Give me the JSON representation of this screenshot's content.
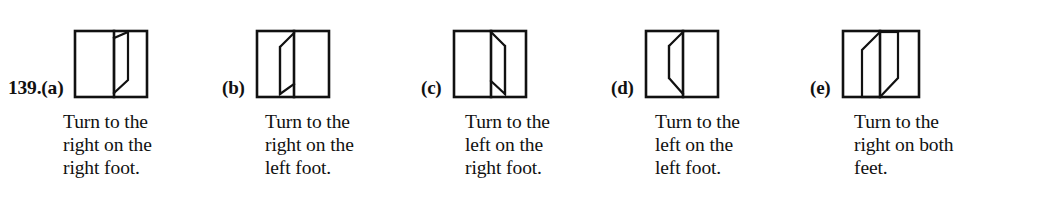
{
  "question": {
    "number": "139.",
    "number_with_first_option": "139.(a)"
  },
  "options": [
    {
      "id": "a",
      "label": "(a)",
      "caption": "Turn to the\nright on the\nright foot.",
      "caption_lines": [
        "Turn to the",
        "right on the",
        "right foot."
      ],
      "figure": {
        "name": "folded-flap-square-a",
        "description": "Square with a vertical crease line right of center and a flap folded open to the right"
      }
    },
    {
      "id": "b",
      "label": "(b)",
      "caption": "Turn to the\nright on the\nleft foot.",
      "caption_lines": [
        "Turn to the",
        "right on the",
        "left foot."
      ],
      "figure": {
        "name": "folded-flap-square-b",
        "description": "Square with a vertical crease line at center and a flap folded open to the left"
      }
    },
    {
      "id": "c",
      "label": "(c)",
      "caption": "Turn to the\nleft on the\nright foot.",
      "caption_lines": [
        "Turn to the",
        "left on the",
        "right foot."
      ],
      "figure": {
        "name": "folded-flap-square-c",
        "description": "Square with a vertical crease line right of center and a narrow flap folded to the right, slanting down"
      }
    },
    {
      "id": "d",
      "label": "(d)",
      "caption": "Turn to the\nleft on the\nleft foot.",
      "caption_lines": [
        "Turn to the",
        "left on the",
        "left foot."
      ],
      "figure": {
        "name": "folded-flap-square-d",
        "description": "Square with a vertical crease line at center and a narrow flap folded to the left, slanting down"
      }
    },
    {
      "id": "e",
      "label": "(e)",
      "caption": "Turn to the\nright on both\nfeet.",
      "caption_lines": [
        "Turn to the",
        "right on both",
        "feet."
      ],
      "figure": {
        "name": "folded-flap-square-e",
        "description": "Square with two parallel flaps forming a wide parallelogram band across the middle"
      }
    }
  ],
  "colors": {
    "ink": "#111111",
    "background": "#ffffff"
  }
}
